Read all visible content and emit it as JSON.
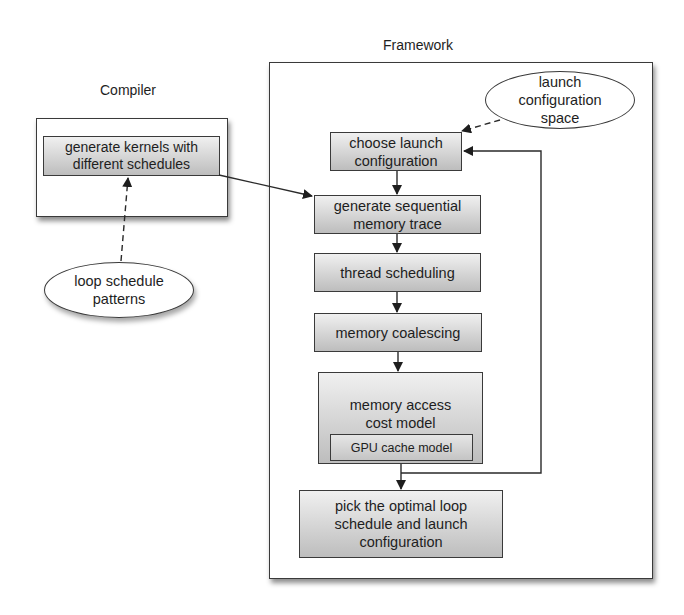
{
  "compiler": {
    "title": "Compiler",
    "step": {
      "line1": "generate kernels with",
      "line2": "different schedules"
    },
    "input": {
      "line1": "loop schedule",
      "line2": "patterns"
    }
  },
  "framework": {
    "title": "Framework",
    "input": {
      "line1": "launch",
      "line2": "configuration",
      "line3": "space"
    },
    "steps": [
      {
        "line1": "choose launch",
        "line2": "configuration"
      },
      {
        "line1": "generate sequential",
        "line2": "memory trace"
      },
      {
        "line1": "thread scheduling"
      },
      {
        "line1": "memory coalescing"
      },
      {
        "line1": "memory access",
        "line2": "cost model",
        "sub": "GPU cache model"
      }
    ],
    "output": {
      "line1": "pick the optimal loop",
      "line2": "schedule and launch",
      "line3": "configuration"
    }
  },
  "colors": {
    "stroke": "#3a3a3a",
    "box_top": "#f0f0f0",
    "box_bottom": "#bdbdbd"
  }
}
